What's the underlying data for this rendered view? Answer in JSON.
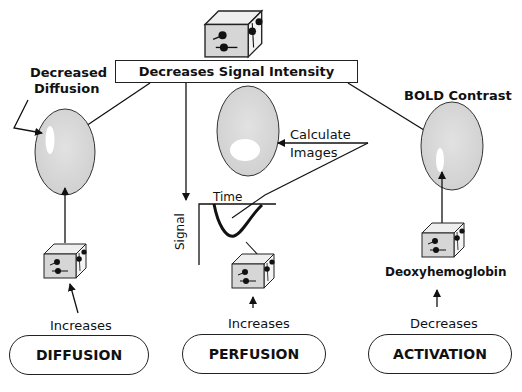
{
  "header": {
    "label": "Decreases Signal Intensity"
  },
  "left": {
    "title_line1": "Decreased",
    "title_line2": "Diffusion",
    "change_label": "Increases",
    "process": "DIFFUSION"
  },
  "center": {
    "calc_line1": "Calculate",
    "calc_line2": "Images",
    "curve_xlabel": "Time",
    "curve_ylabel": "Signal",
    "change_label": "Increases",
    "process": "PERFUSION"
  },
  "right": {
    "title": "BOLD Contrast",
    "molecule_label": "Deoxyhemoglobin",
    "change_label": "Decreases",
    "process": "ACTIVATION"
  },
  "colors": {
    "brain_fill": "#d4d4d4",
    "cube_fill": "#d9d9d9",
    "line": "#111111",
    "highlight": "#ffffff"
  }
}
